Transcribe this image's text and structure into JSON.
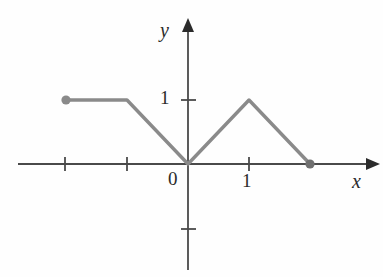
{
  "figure": {
    "title": "",
    "background_color": "#fefefe"
  },
  "axes": {
    "x_axis_label": "x",
    "y_axis_label": "y",
    "origin_label": "0",
    "x_tick_label_one": "1",
    "y_tick_label_one": "1",
    "axis_color": "#4a4a4a",
    "arrow_color": "#2b2b2b",
    "x_range": [
      -2.95,
      3.05
    ],
    "y_range": [
      -1.75,
      2.0
    ],
    "x_ticks": [
      -2,
      -1,
      1,
      2
    ],
    "y_ticks": [
      -1,
      1
    ],
    "grid": false
  },
  "chart_data": {
    "type": "line",
    "title": "",
    "xlabel": "x",
    "ylabel": "y",
    "xlim": [
      -2.95,
      3.05
    ],
    "ylim": [
      -1.75,
      2.0
    ],
    "grid": false,
    "legend": null,
    "series": [
      {
        "name": "piecewise-function",
        "color": "#8a8a8a",
        "line_width": 3,
        "x": [
          -2,
          -1,
          0,
          1,
          2
        ],
        "y": [
          1,
          1,
          0,
          1,
          0
        ],
        "points": [
          {
            "x": -2,
            "y": 1,
            "marker": "filled-circle"
          },
          {
            "x": -1,
            "y": 1,
            "marker": "none"
          },
          {
            "x": 0,
            "y": 0,
            "marker": "none"
          },
          {
            "x": 1,
            "y": 1,
            "marker": "none"
          },
          {
            "x": 2,
            "y": 0,
            "marker": "filled-circle"
          }
        ]
      }
    ],
    "annotations": []
  }
}
